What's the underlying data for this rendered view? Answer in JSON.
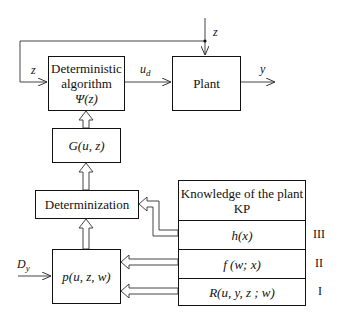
{
  "diagram": {
    "type": "block-diagram",
    "blocks": {
      "algorithm": {
        "line1": "Deterministic",
        "line2": "algorithm",
        "line3": "Ψ(z)"
      },
      "plant": {
        "label": "Plant"
      },
      "g": {
        "label": "G(u, z)"
      },
      "determinization": {
        "label": "Determinization"
      },
      "p": {
        "label": "p(u, z, w)"
      },
      "kp": {
        "header_line1": "Knowledge of the plant",
        "header_line2": "KP",
        "rows": [
          {
            "label": "h(x)",
            "level": "III"
          },
          {
            "label": "f (w; x)",
            "level": "II"
          },
          {
            "label": "R(u, y, z ; w)",
            "level": "I"
          }
        ]
      }
    },
    "signals": {
      "z_top": "z",
      "z_left": "z",
      "u_d": "u",
      "u_d_sub": "d",
      "y": "y",
      "d_y": "D",
      "d_y_sub": "y"
    }
  }
}
